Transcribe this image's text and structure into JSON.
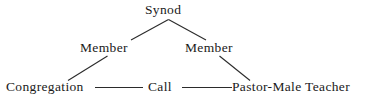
{
  "diagram": {
    "type": "organizational-relationship-diagram",
    "background_color": "#ffffff",
    "line_color": "#2b2b2b",
    "text_color": "#1a1a1a",
    "nodes": [
      {
        "id": "synod",
        "label": "Synod"
      },
      {
        "id": "congregation",
        "label": "Congregation"
      },
      {
        "id": "pastor",
        "label": "Pastor-Male Teacher"
      }
    ],
    "edges": [
      {
        "id": "synod-congregation",
        "from": "synod",
        "to": "congregation",
        "label": "Member"
      },
      {
        "id": "synod-pastor",
        "from": "synod",
        "to": "pastor",
        "label": "Member"
      },
      {
        "id": "congregation-pastor",
        "from": "congregation",
        "to": "pastor",
        "label": "Call"
      }
    ],
    "labels": {
      "synod": "Synod",
      "member_left": "Member",
      "member_right": "Member",
      "congregation": "Congregation",
      "call": "Call",
      "pastor": "Pastor-Male Teacher"
    }
  }
}
